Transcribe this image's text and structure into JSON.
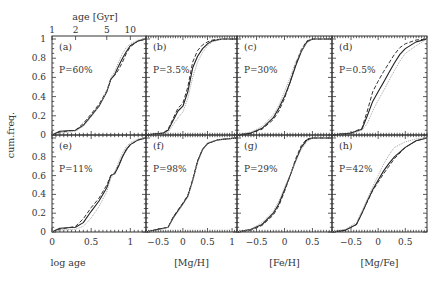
{
  "chart_data": {
    "type": "line",
    "title": "",
    "ylabel": "cum.freq.",
    "top_axis": {
      "label": "age [Gyr]",
      "ticks": [
        "1",
        "2",
        "5",
        "10"
      ],
      "tick_values_log": [
        0,
        0.301,
        0.699,
        1.0
      ]
    },
    "yticks": [
      "0",
      "0.2",
      "0.4",
      "0.6",
      "0.8",
      "1"
    ],
    "ylim": [
      0,
      1
    ],
    "legend": [
      {
        "name": "sample A",
        "style": "solid"
      },
      {
        "name": "sample B",
        "style": "dashed"
      },
      {
        "name": "sample C",
        "style": "dotted"
      }
    ],
    "columns": [
      {
        "xlabel": "log age",
        "xlim": [
          0,
          1.2
        ],
        "xticks": [
          0,
          0.5,
          1
        ],
        "xtick_labels": [
          "0",
          "0.5",
          "1"
        ]
      },
      {
        "xlabel": "[Mg/H]",
        "xlim": [
          -0.75,
          1.1
        ],
        "xticks": [
          -0.5,
          0,
          0.5,
          1
        ],
        "xtick_labels": [
          "-0.5",
          "0",
          "0.5",
          "1"
        ]
      },
      {
        "xlabel": "[Fe/H]",
        "xlim": [
          -0.85,
          0.85
        ],
        "xticks": [
          -0.5,
          0,
          0.5
        ],
        "xtick_labels": [
          "-0.5",
          "0",
          "0.5"
        ]
      },
      {
        "xlabel": "[Mg/Fe]",
        "xlim": [
          -0.85,
          0.9
        ],
        "xticks": [
          -0.5,
          0,
          0.5
        ],
        "xtick_labels": [
          "-0.5",
          "0",
          "0.5"
        ]
      }
    ],
    "panels": [
      {
        "tag": "(a)",
        "p": "P=60%",
        "row": 0,
        "col": 0,
        "series": [
          {
            "style": "solid",
            "x": [
              0,
              0.1,
              0.3,
              0.4,
              0.5,
              0.6,
              0.7,
              0.75,
              0.8,
              0.85,
              0.9,
              0.95,
              1.0,
              1.1,
              1.2
            ],
            "y": [
              0,
              0.04,
              0.05,
              0.1,
              0.2,
              0.3,
              0.45,
              0.58,
              0.63,
              0.72,
              0.8,
              0.87,
              0.93,
              0.98,
              1
            ]
          },
          {
            "style": "dashed",
            "x": [
              0,
              0.1,
              0.3,
              0.4,
              0.5,
              0.6,
              0.7,
              0.75,
              0.8,
              0.85,
              0.9,
              0.95,
              1.0,
              1.1,
              1.2
            ],
            "y": [
              0,
              0.03,
              0.05,
              0.12,
              0.22,
              0.32,
              0.46,
              0.58,
              0.62,
              0.68,
              0.76,
              0.85,
              0.92,
              0.98,
              1
            ]
          },
          {
            "style": "dotted",
            "x": [
              0,
              0.1,
              0.3,
              0.4,
              0.5,
              0.6,
              0.7,
              0.75,
              0.8,
              0.85,
              0.9,
              0.95,
              1.0,
              1.1,
              1.2
            ],
            "y": [
              0,
              0.02,
              0.04,
              0.09,
              0.19,
              0.3,
              0.46,
              0.6,
              0.66,
              0.76,
              0.85,
              0.91,
              0.95,
              0.99,
              1
            ]
          }
        ]
      },
      {
        "tag": "(b)",
        "p": "P=3.5%",
        "row": 0,
        "col": 1,
        "series": [
          {
            "style": "solid",
            "x": [
              -0.75,
              -0.4,
              -0.3,
              -0.1,
              0,
              0.1,
              0.2,
              0.3,
              0.4,
              0.5,
              0.6,
              0.8,
              1.1
            ],
            "y": [
              0,
              0.02,
              0.05,
              0.25,
              0.3,
              0.45,
              0.7,
              0.82,
              0.9,
              0.95,
              0.98,
              1,
              1
            ]
          },
          {
            "style": "dashed",
            "x": [
              -0.75,
              -0.4,
              -0.3,
              -0.1,
              0,
              0.1,
              0.2,
              0.3,
              0.4,
              0.5,
              0.6,
              0.8,
              1.1
            ],
            "y": [
              0,
              0.02,
              0.06,
              0.28,
              0.33,
              0.5,
              0.76,
              0.88,
              0.94,
              0.97,
              0.99,
              1,
              1
            ]
          },
          {
            "style": "dotted",
            "x": [
              -0.75,
              -0.4,
              -0.3,
              -0.1,
              0,
              0.1,
              0.2,
              0.3,
              0.4,
              0.5,
              0.6,
              0.8,
              1.1
            ],
            "y": [
              0,
              0.01,
              0.03,
              0.18,
              0.24,
              0.38,
              0.6,
              0.76,
              0.86,
              0.93,
              0.97,
              1,
              1
            ]
          }
        ]
      },
      {
        "tag": "(c)",
        "p": "P=30%",
        "row": 0,
        "col": 2,
        "series": [
          {
            "style": "solid",
            "x": [
              -0.85,
              -0.6,
              -0.4,
              -0.2,
              -0.1,
              0,
              0.1,
              0.2,
              0.3,
              0.4,
              0.5,
              0.85
            ],
            "y": [
              0,
              0.02,
              0.07,
              0.18,
              0.28,
              0.4,
              0.55,
              0.72,
              0.87,
              0.97,
              1,
              1
            ]
          },
          {
            "style": "dashed",
            "x": [
              -0.85,
              -0.6,
              -0.4,
              -0.2,
              -0.1,
              0,
              0.1,
              0.2,
              0.3,
              0.4,
              0.5,
              0.85
            ],
            "y": [
              0,
              0.02,
              0.06,
              0.16,
              0.25,
              0.38,
              0.55,
              0.74,
              0.89,
              0.98,
              1,
              1
            ]
          },
          {
            "style": "dotted",
            "x": [
              -0.85,
              -0.6,
              -0.4,
              -0.2,
              -0.1,
              0,
              0.1,
              0.2,
              0.3,
              0.4,
              0.5,
              0.85
            ],
            "y": [
              0,
              0.03,
              0.09,
              0.21,
              0.31,
              0.45,
              0.6,
              0.76,
              0.88,
              0.96,
              1,
              1
            ]
          }
        ]
      },
      {
        "tag": "(d)",
        "p": "P=0.5%",
        "row": 0,
        "col": 3,
        "series": [
          {
            "style": "solid",
            "x": [
              -0.85,
              -0.5,
              -0.3,
              -0.2,
              -0.1,
              0,
              0.1,
              0.2,
              0.3,
              0.4,
              0.5,
              0.7,
              0.9
            ],
            "y": [
              0,
              0.02,
              0.06,
              0.2,
              0.35,
              0.45,
              0.55,
              0.65,
              0.75,
              0.84,
              0.9,
              0.97,
              1
            ]
          },
          {
            "style": "dashed",
            "x": [
              -0.85,
              -0.5,
              -0.3,
              -0.2,
              -0.1,
              0,
              0.1,
              0.2,
              0.3,
              0.4,
              0.5,
              0.7,
              0.9
            ],
            "y": [
              0,
              0.02,
              0.07,
              0.25,
              0.45,
              0.56,
              0.66,
              0.75,
              0.84,
              0.91,
              0.95,
              0.99,
              1
            ]
          },
          {
            "style": "dotted",
            "x": [
              -0.85,
              -0.5,
              -0.3,
              -0.2,
              -0.1,
              0,
              0.1,
              0.2,
              0.3,
              0.4,
              0.5,
              0.7,
              0.9
            ],
            "y": [
              0,
              0.01,
              0.05,
              0.12,
              0.25,
              0.36,
              0.46,
              0.57,
              0.67,
              0.77,
              0.85,
              0.93,
              1
            ]
          }
        ]
      },
      {
        "tag": "(e)",
        "p": "P=11%",
        "row": 1,
        "col": 0,
        "series": [
          {
            "style": "solid",
            "x": [
              0,
              0.1,
              0.3,
              0.4,
              0.5,
              0.6,
              0.7,
              0.75,
              0.8,
              0.85,
              0.9,
              0.95,
              1.0,
              1.1,
              1.2
            ],
            "y": [
              0,
              0.04,
              0.05,
              0.1,
              0.22,
              0.33,
              0.47,
              0.6,
              0.62,
              0.7,
              0.8,
              0.88,
              0.93,
              0.98,
              1
            ]
          },
          {
            "style": "dashed",
            "x": [
              0,
              0.1,
              0.3,
              0.4,
              0.5,
              0.6,
              0.7,
              0.75,
              0.8,
              0.85,
              0.9,
              0.95,
              1.0,
              1.1,
              1.2
            ],
            "y": [
              0,
              0.03,
              0.06,
              0.14,
              0.26,
              0.36,
              0.5,
              0.6,
              0.63,
              0.71,
              0.8,
              0.87,
              0.93,
              0.98,
              1
            ]
          },
          {
            "style": "dotted",
            "x": [
              0,
              0.1,
              0.3,
              0.4,
              0.5,
              0.6,
              0.7,
              0.75,
              0.8,
              0.85,
              0.9,
              0.95,
              1.0,
              1.1,
              1.2
            ],
            "y": [
              0,
              0.02,
              0.03,
              0.06,
              0.15,
              0.27,
              0.43,
              0.57,
              0.64,
              0.74,
              0.84,
              0.91,
              0.95,
              0.99,
              1
            ]
          }
        ]
      },
      {
        "tag": "(f)",
        "p": "P=98%",
        "row": 1,
        "col": 1,
        "series": [
          {
            "style": "solid",
            "x": [
              -0.75,
              -0.5,
              -0.3,
              -0.2,
              0,
              0.1,
              0.2,
              0.3,
              0.4,
              0.5,
              0.7,
              0.9,
              1.1
            ],
            "y": [
              0,
              0.03,
              0.05,
              0.15,
              0.3,
              0.38,
              0.55,
              0.75,
              0.88,
              0.94,
              0.98,
              0.99,
              1
            ]
          },
          {
            "style": "dashed",
            "x": [
              -0.75,
              -0.5,
              -0.3,
              -0.2,
              0,
              0.1,
              0.2,
              0.3,
              0.4,
              0.5,
              0.7,
              0.9,
              1.1
            ],
            "y": [
              0,
              0.03,
              0.05,
              0.16,
              0.31,
              0.39,
              0.56,
              0.76,
              0.88,
              0.94,
              0.98,
              0.99,
              1
            ]
          },
          {
            "style": "dotted",
            "x": [
              -0.75,
              -0.5,
              -0.3,
              -0.2,
              0,
              0.1,
              0.2,
              0.3,
              0.4,
              0.5,
              0.7,
              0.9,
              1.1
            ],
            "y": [
              0,
              0.02,
              0.05,
              0.14,
              0.29,
              0.37,
              0.54,
              0.74,
              0.87,
              0.95,
              0.98,
              0.99,
              1
            ]
          }
        ]
      },
      {
        "tag": "(g)",
        "p": "P=29%",
        "row": 1,
        "col": 2,
        "series": [
          {
            "style": "solid",
            "x": [
              -0.85,
              -0.6,
              -0.4,
              -0.2,
              -0.1,
              0,
              0.1,
              0.2,
              0.3,
              0.4,
              0.5,
              0.85
            ],
            "y": [
              0,
              0.03,
              0.08,
              0.2,
              0.3,
              0.45,
              0.6,
              0.76,
              0.9,
              0.98,
              1,
              1
            ]
          },
          {
            "style": "dashed",
            "x": [
              -0.85,
              -0.6,
              -0.4,
              -0.2,
              -0.1,
              0,
              0.1,
              0.2,
              0.3,
              0.4,
              0.5,
              0.85
            ],
            "y": [
              0,
              0.02,
              0.07,
              0.18,
              0.28,
              0.43,
              0.6,
              0.78,
              0.92,
              0.99,
              1,
              1
            ]
          },
          {
            "style": "dotted",
            "x": [
              -0.85,
              -0.6,
              -0.4,
              -0.2,
              -0.1,
              0,
              0.1,
              0.2,
              0.3,
              0.4,
              0.5,
              0.85
            ],
            "y": [
              0,
              0.03,
              0.1,
              0.22,
              0.33,
              0.47,
              0.61,
              0.75,
              0.88,
              0.96,
              1,
              1
            ]
          }
        ]
      },
      {
        "tag": "(h)",
        "p": "P=42%",
        "row": 1,
        "col": 3,
        "series": [
          {
            "style": "solid",
            "x": [
              -0.85,
              -0.6,
              -0.4,
              -0.3,
              -0.2,
              -0.1,
              0,
              0.1,
              0.2,
              0.3,
              0.5,
              0.7,
              0.9
            ],
            "y": [
              0,
              0.02,
              0.08,
              0.2,
              0.33,
              0.45,
              0.55,
              0.65,
              0.73,
              0.8,
              0.9,
              0.97,
              1
            ]
          },
          {
            "style": "dashed",
            "x": [
              -0.85,
              -0.6,
              -0.4,
              -0.3,
              -0.2,
              -0.1,
              0,
              0.1,
              0.2,
              0.3,
              0.5,
              0.7,
              0.9
            ],
            "y": [
              0,
              0.02,
              0.08,
              0.2,
              0.32,
              0.44,
              0.53,
              0.62,
              0.7,
              0.78,
              0.9,
              0.97,
              1
            ]
          },
          {
            "style": "dotted",
            "x": [
              -0.85,
              -0.6,
              -0.4,
              -0.3,
              -0.2,
              -0.1,
              0,
              0.1,
              0.2,
              0.3,
              0.5,
              0.7,
              0.9
            ],
            "y": [
              0,
              0.03,
              0.1,
              0.22,
              0.35,
              0.48,
              0.6,
              0.72,
              0.82,
              0.9,
              0.96,
              0.99,
              1
            ]
          }
        ]
      }
    ],
    "layout": {
      "col_edges": [
        52,
        146,
        237,
        332,
        427
      ],
      "row_edges": [
        36,
        135,
        232
      ]
    }
  }
}
